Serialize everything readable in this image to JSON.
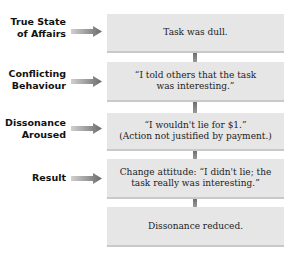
{
  "diagram": {
    "type": "flowchart",
    "title": "",
    "steps": [
      {
        "label": "True State of Affairs",
        "label_lines": [
          "True State",
          "of Affairs"
        ],
        "text_lines": [
          "Task was dull."
        ]
      },
      {
        "label": "Conflicting Behaviour",
        "label_lines": [
          "Conflicting",
          "Behaviour"
        ],
        "text_lines": [
          "“I told others that the task",
          "was interesting.”"
        ]
      },
      {
        "label": "Dissonance Aroused",
        "label_lines": [
          "Dissonance",
          "Aroused"
        ],
        "text_lines": [
          "“I wouldn't lie for $1.”",
          "(Action not justified by payment.)"
        ]
      },
      {
        "label": "Result",
        "label_lines": [
          "Result"
        ],
        "text_lines": [
          "Change attitude: “I didn't lie; the",
          "task really was interesting.”"
        ]
      },
      {
        "label": "",
        "label_lines": [],
        "text_lines": [
          "Dissonance reduced."
        ]
      }
    ],
    "colors": {
      "box_fill": "#e6e6e6",
      "box_shadow": "#c9c9c9",
      "arrow_start": "#d0d0d0",
      "arrow_end": "#6a6a6a",
      "connector": "#7a7a7a"
    }
  }
}
